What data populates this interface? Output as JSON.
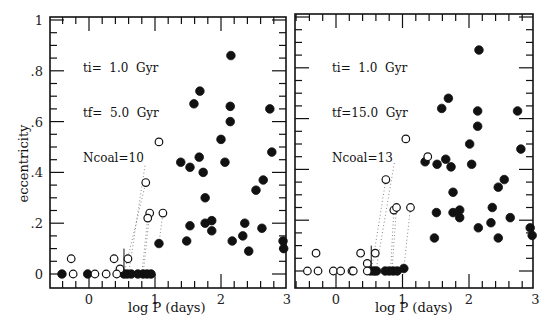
{
  "chart_data": [
    {
      "type": "scatter",
      "panel": "left",
      "title": "",
      "xlabel": "log P (days)",
      "ylabel": "eccentricity",
      "xlim": [
        -0.6,
        3.0
      ],
      "ylim": [
        -0.05,
        1.0
      ],
      "xticks": [
        "0",
        "1",
        "2",
        "3"
      ],
      "yticks": [
        "0",
        ".2",
        ".4",
        ".6",
        ".8",
        "1"
      ],
      "grid": false,
      "annotation": [
        "ti= 1.0 Gyr",
        "tf= 5.0 Gyr",
        "Ncoal=10"
      ],
      "series": [
        {
          "name": "filled",
          "marker": "filled-circle",
          "points": [
            [
              2.15,
              0.86
            ],
            [
              1.68,
              0.72
            ],
            [
              1.59,
              0.67
            ],
            [
              2.14,
              0.66
            ],
            [
              2.74,
              0.65
            ],
            [
              2.14,
              0.6
            ],
            [
              2.0,
              0.53
            ],
            [
              2.77,
              0.48
            ],
            [
              1.39,
              0.44
            ],
            [
              1.67,
              0.46
            ],
            [
              1.53,
              0.42
            ],
            [
              1.73,
              0.4
            ],
            [
              2.06,
              0.44
            ],
            [
              1.76,
              0.3
            ],
            [
              2.53,
              0.33
            ],
            [
              2.64,
              0.37
            ],
            [
              1.53,
              0.19
            ],
            [
              1.76,
              0.2
            ],
            [
              1.86,
              0.21
            ],
            [
              1.86,
              0.17
            ],
            [
              2.36,
              0.2
            ],
            [
              2.17,
              0.13
            ],
            [
              2.33,
              0.15
            ],
            [
              2.62,
              0.18
            ],
            [
              1.48,
              0.13
            ],
            [
              2.42,
              0.09
            ],
            [
              2.94,
              0.13
            ],
            [
              2.95,
              0.1
            ],
            [
              1.06,
              0.12
            ],
            [
              -0.41,
              0.0
            ],
            [
              -0.02,
              0.0
            ],
            [
              0.53,
              0.0
            ],
            [
              0.58,
              0.0
            ],
            [
              0.64,
              0.0
            ],
            [
              0.74,
              0.0
            ],
            [
              0.82,
              0.0
            ],
            [
              0.88,
              0.0
            ],
            [
              0.94,
              0.0
            ]
          ]
        },
        {
          "name": "open",
          "marker": "open-circle",
          "points": [
            [
              1.06,
              0.52
            ],
            [
              0.86,
              0.36
            ],
            [
              0.92,
              0.24
            ],
            [
              0.89,
              0.22
            ],
            [
              1.12,
              0.24
            ],
            [
              -0.27,
              0.06
            ],
            [
              0.38,
              0.06
            ],
            [
              0.59,
              0.06
            ],
            [
              0.47,
              0.02
            ],
            [
              -0.24,
              0.0
            ],
            [
              0.09,
              0.0
            ],
            [
              0.26,
              0.0
            ],
            [
              0.42,
              0.0
            ]
          ]
        }
      ],
      "trails": [
        [
          [
            0.53,
            0.0
          ],
          [
            0.86,
            0.36
          ]
        ],
        [
          [
            0.6,
            0.0
          ],
          [
            0.85,
            0.43
          ]
        ],
        [
          [
            0.82,
            0.0
          ],
          [
            0.92,
            0.24
          ]
        ],
        [
          [
            0.8,
            0.0
          ],
          [
            0.89,
            0.22
          ]
        ],
        [
          [
            1.06,
            0.12
          ],
          [
            1.12,
            0.24
          ]
        ]
      ]
    },
    {
      "type": "scatter",
      "panel": "right",
      "title": "",
      "xlabel": "log P (days)",
      "ylabel": "",
      "xlim": [
        -0.6,
        3.0
      ],
      "ylim": [
        -0.05,
        1.0
      ],
      "xticks": [
        "0",
        "1",
        "2",
        "3"
      ],
      "yticks": [],
      "grid": false,
      "annotation": [
        "ti= 1.0 Gyr",
        "tf=15.0 Gyr",
        "Ncoal=13"
      ],
      "series": [
        {
          "name": "filled",
          "marker": "filled-circle",
          "points": [
            [
              2.15,
              0.87
            ],
            [
              1.69,
              0.68
            ],
            [
              1.59,
              0.64
            ],
            [
              2.13,
              0.63
            ],
            [
              2.73,
              0.63
            ],
            [
              2.13,
              0.57
            ],
            [
              2.01,
              0.5
            ],
            [
              2.78,
              0.48
            ],
            [
              1.34,
              0.43
            ],
            [
              1.52,
              0.42
            ],
            [
              1.65,
              0.44
            ],
            [
              1.73,
              0.41
            ],
            [
              2.04,
              0.42
            ],
            [
              1.76,
              0.31
            ],
            [
              2.53,
              0.36
            ],
            [
              2.44,
              0.33
            ],
            [
              1.51,
              0.23
            ],
            [
              1.76,
              0.23
            ],
            [
              1.86,
              0.24
            ],
            [
              1.86,
              0.21
            ],
            [
              2.35,
              0.25
            ],
            [
              2.14,
              0.17
            ],
            [
              2.33,
              0.19
            ],
            [
              2.62,
              0.21
            ],
            [
              1.48,
              0.13
            ],
            [
              2.44,
              0.13
            ],
            [
              2.92,
              0.17
            ],
            [
              2.95,
              0.14
            ],
            [
              0.52,
              0.0
            ],
            [
              0.57,
              0.0
            ],
            [
              0.61,
              0.0
            ],
            [
              0.74,
              0.0
            ],
            [
              0.8,
              0.0
            ],
            [
              0.86,
              0.0
            ],
            [
              0.92,
              0.0
            ],
            [
              1.02,
              0.01
            ]
          ]
        },
        {
          "name": "open",
          "marker": "open-circle",
          "points": [
            [
              1.38,
              0.45
            ],
            [
              1.05,
              0.52
            ],
            [
              0.75,
              0.36
            ],
            [
              0.87,
              0.24
            ],
            [
              0.91,
              0.25
            ],
            [
              1.12,
              0.25
            ],
            [
              -0.3,
              0.07
            ],
            [
              0.37,
              0.07
            ],
            [
              0.59,
              0.07
            ],
            [
              0.47,
              0.03
            ],
            [
              -0.43,
              0.0
            ],
            [
              -0.27,
              0.0
            ],
            [
              -0.04,
              0.0
            ],
            [
              0.07,
              0.0
            ],
            [
              0.24,
              0.0
            ],
            [
              0.26,
              0.0
            ],
            [
              0.47,
              0.0
            ]
          ]
        }
      ],
      "trails": [
        [
          [
            0.53,
            0.0
          ],
          [
            0.75,
            0.36
          ]
        ],
        [
          [
            0.6,
            0.0
          ],
          [
            0.88,
            0.43
          ]
        ],
        [
          [
            0.82,
            0.0
          ],
          [
            0.87,
            0.24
          ]
        ],
        [
          [
            0.84,
            0.0
          ],
          [
            0.91,
            0.25
          ]
        ],
        [
          [
            1.02,
            0.01
          ],
          [
            1.12,
            0.25
          ]
        ]
      ]
    }
  ],
  "panels": {
    "left": {
      "annotation": {
        "line1": "ti=  1.0  Gyr",
        "line2": "tf=  5.0  Gyr",
        "line3": "Ncoal=10"
      },
      "xlabel": "log P (days)",
      "ylabel": "eccentricity",
      "yticks": [
        "1",
        ".8",
        ".6",
        ".4",
        ".2",
        "0"
      ],
      "xticks": [
        "0",
        "1",
        "2",
        "3"
      ]
    },
    "right": {
      "annotation": {
        "line1": "ti=  1.0  Gyr",
        "line2": "tf=15.0  Gyr",
        "line3": "Ncoal=13"
      },
      "xlabel": "log P (days)",
      "xticks": [
        "0",
        "1",
        "2",
        "3"
      ]
    }
  },
  "colors": {
    "ink": "#111111",
    "trail": "#888888",
    "background": "#ffffff"
  }
}
